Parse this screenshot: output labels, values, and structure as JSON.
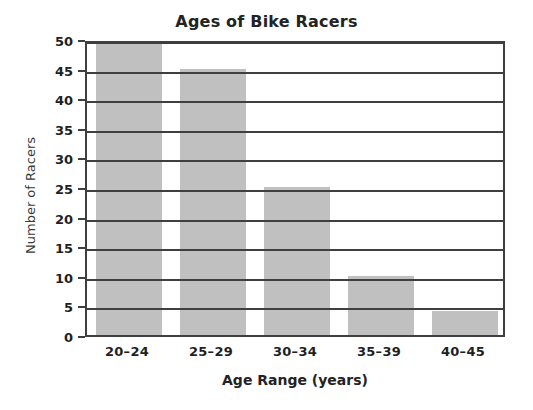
{
  "chart_data": {
    "type": "bar",
    "title": "Ages of Bike Racers",
    "xlabel": "Age Range (years)",
    "ylabel": "Number of Racers",
    "categories": [
      "20–24",
      "25–29",
      "30–34",
      "35–39",
      "40–45"
    ],
    "values": [
      50,
      45,
      25,
      10,
      4
    ],
    "ylim": [
      0,
      50
    ],
    "ytick_labels": [
      "0",
      "5",
      "10",
      "15",
      "20",
      "25",
      "30",
      "35",
      "40",
      "45",
      "50"
    ],
    "ytick_values": [
      0,
      5,
      10,
      15,
      20,
      25,
      30,
      35,
      40,
      45,
      50
    ],
    "grid": "horizontal",
    "legend": "none",
    "colors": {
      "bar_fill": "#c0c0c0",
      "axis": "#3f3f3f",
      "text": "#1f1f1f",
      "background": "#ffffff"
    }
  }
}
